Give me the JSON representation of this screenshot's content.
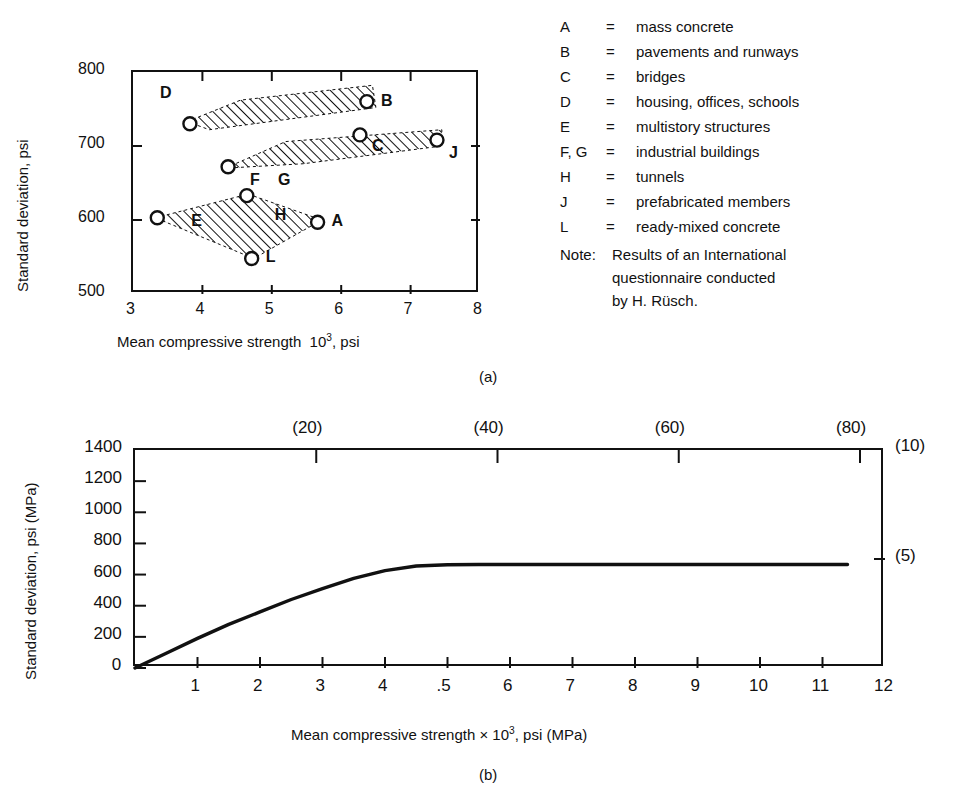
{
  "figure": {
    "panel_a_caption": "(a)",
    "panel_b_caption": "(b)"
  },
  "legend": {
    "items": [
      {
        "key": "A",
        "eq": "=",
        "desc": "mass concrete"
      },
      {
        "key": "B",
        "eq": "=",
        "desc": "pavements and runways"
      },
      {
        "key": "C",
        "eq": "=",
        "desc": "bridges"
      },
      {
        "key": "D",
        "eq": "=",
        "desc": "housing, offices, schools"
      },
      {
        "key": "E",
        "eq": "=",
        "desc": "multistory structures"
      },
      {
        "key": "F, G",
        "eq": "=",
        "desc": "industrial buildings"
      },
      {
        "key": "H",
        "eq": "=",
        "desc": "tunnels"
      },
      {
        "key": "J",
        "eq": "=",
        "desc": "prefabricated members"
      },
      {
        "key": "L",
        "eq": "=",
        "desc": "ready-mixed concrete"
      }
    ],
    "note_label": "Note:",
    "note_lines": [
      "Results of an International",
      "questionnaire conducted",
      "by H. Rüsch."
    ]
  },
  "chart_data": [
    {
      "id": "panel-a",
      "type": "scatter",
      "title": "",
      "xlabel_parts": {
        "pre": "Mean compressive strength",
        "exp_base": "10",
        "exp": "3",
        "post": ", psi"
      },
      "xlabel": "Mean compressive strength 10³ , psi",
      "ylabel": "Standard deviation, psi",
      "xlim": [
        3,
        8
      ],
      "ylim": [
        500,
        800
      ],
      "xticks": [
        3,
        4,
        5,
        6,
        7,
        8
      ],
      "yticks": [
        500,
        600,
        700,
        800
      ],
      "xtick_labels": [
        "3",
        "4",
        "5",
        "6",
        "7",
        "8"
      ],
      "ytick_labels": [
        "500",
        "600",
        "700",
        "800"
      ],
      "grid": false,
      "legend_position": "right-external",
      "points": [
        {
          "label": "A",
          "x": 5.66,
          "y": 597,
          "label_dx": 16,
          "label_dy": 2
        },
        {
          "label": "B",
          "x": 6.37,
          "y": 760,
          "label_dx": 16,
          "label_dy": 2
        },
        {
          "label": "C",
          "x": 6.27,
          "y": 715,
          "label_dx": 14,
          "label_dy": 14
        },
        {
          "label": "D",
          "x": 3.82,
          "y": 730,
          "label_dx": -28,
          "label_dy": -28
        },
        {
          "label": "E",
          "x": 3.35,
          "y": 603,
          "label_dx": 36,
          "label_dy": 6
        },
        {
          "label": "F",
          "x": 4.37,
          "y": 672,
          "label_dx": 24,
          "label_dy": 16
        },
        {
          "label": "G",
          "x": 4.37,
          "y": 672,
          "label_dx": 52,
          "label_dy": 16
        },
        {
          "label": "H",
          "x": 4.64,
          "y": 633,
          "label_dx": 30,
          "label_dy": 22
        },
        {
          "label": "J",
          "x": 7.38,
          "y": 708,
          "label_dx": 14,
          "label_dy": 16
        },
        {
          "label": "L",
          "x": 4.71,
          "y": 548,
          "label_dx": 16,
          "label_dy": 2
        }
      ],
      "bands": [
        {
          "name": "upper-band",
          "vertices": [
            [
              3.78,
              733
            ],
            [
              4.55,
              762
            ],
            [
              6.45,
              782
            ],
            [
              6.5,
              752
            ],
            [
              4.1,
              722
            ]
          ]
        },
        {
          "name": "middle-band",
          "vertices": [
            [
              4.33,
              670
            ],
            [
              5.2,
              706
            ],
            [
              7.45,
              722
            ],
            [
              7.45,
              700
            ],
            [
              5.45,
              676
            ]
          ]
        },
        {
          "name": "lower-band",
          "vertices": [
            [
              3.32,
              603
            ],
            [
              4.66,
              635
            ],
            [
              5.72,
              600
            ],
            [
              4.74,
              548
            ]
          ]
        }
      ]
    },
    {
      "id": "panel-b",
      "type": "line",
      "title": "",
      "xlabel_parts": {
        "pre": "Mean compressive strength ×",
        "exp_base": "10",
        "exp": "3",
        "post": ", psi (MPa)"
      },
      "xlabel": "Mean compressive strength × 10³ , psi (MPa)",
      "ylabel": "Standard deviation, psi (MPa)",
      "xlim": [
        0,
        12
      ],
      "ylim": [
        0,
        1400
      ],
      "xticks": [
        0,
        1,
        2,
        3,
        4,
        5,
        6,
        7,
        8,
        9,
        10,
        11,
        12
      ],
      "xtick_labels": [
        "",
        "1",
        "2",
        "3",
        "4",
        ".5",
        "6",
        "7",
        "8",
        "9",
        "10",
        "11",
        "12"
      ],
      "yticks": [
        0,
        200,
        400,
        600,
        800,
        1000,
        1200,
        1400
      ],
      "ytick_labels": [
        "0",
        "200",
        "400",
        "600",
        "800",
        "1000",
        "1200",
        "1400"
      ],
      "top_axis": {
        "label": "MPa",
        "ticks_mpa": [
          20,
          40,
          60,
          80
        ],
        "tick_labels": [
          "(20)",
          "(40)",
          "(60)",
          "(80)"
        ],
        "ticks_x": [
          2.9,
          5.8,
          8.7,
          11.6
        ]
      },
      "right_axis": {
        "label": "MPa",
        "ticks_psi": [
          1400,
          700
        ],
        "tick_labels": [
          "(10)",
          "(5)"
        ]
      },
      "grid": false,
      "x": [
        0,
        0.5,
        1.0,
        1.5,
        2.0,
        2.5,
        3.0,
        3.5,
        4.0,
        4.5,
        5.0,
        5.5,
        6.0,
        7.0,
        8.0,
        9.0,
        10.0,
        11.0,
        11.4
      ],
      "y": [
        0,
        95,
        190,
        280,
        360,
        440,
        510,
        575,
        625,
        655,
        663,
        665,
        665,
        665,
        665,
        665,
        665,
        665,
        665
      ],
      "series_name": "standard deviation vs mean strength"
    }
  ]
}
